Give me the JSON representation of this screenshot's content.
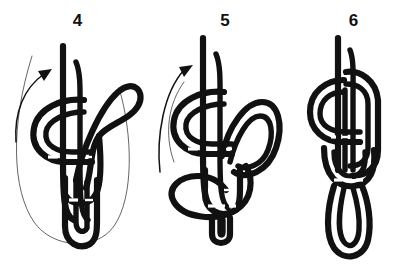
{
  "page": {
    "background_color": "#ffffff",
    "ink_color": "#111111",
    "width": 412,
    "height": 266
  },
  "panels": [
    {
      "id": "panel-4",
      "step_number": "4",
      "caption": "",
      "has_arrow": true,
      "arrow_direction": "up-right",
      "arrow_name": "tuck-direction-arrow",
      "has_ghost_outline": true,
      "ghost_outline_name": "loop-ghost-outline",
      "description": "Doubled standing part with overhand collar, working bight drawn around to the right and down through the knot, faint outline showing the large loop being closed"
    },
    {
      "id": "panel-5",
      "step_number": "5",
      "caption": "",
      "has_arrow": true,
      "arrow_direction": "up-right",
      "arrow_name": "tuck-direction-arrow",
      "has_ghost_outline": true,
      "ghost_outline_name": "loop-ghost-outline",
      "description": "Knot tightening, the large loop pulled down and around the base, small bight emerging at the bottom"
    },
    {
      "id": "panel-6",
      "step_number": "6",
      "caption": "",
      "has_arrow": false,
      "arrow_direction": "",
      "arrow_name": "",
      "has_ghost_outline": false,
      "ghost_outline_name": "",
      "description": "Finished knot drawn up snug with a long doubled bight hanging below"
    }
  ]
}
